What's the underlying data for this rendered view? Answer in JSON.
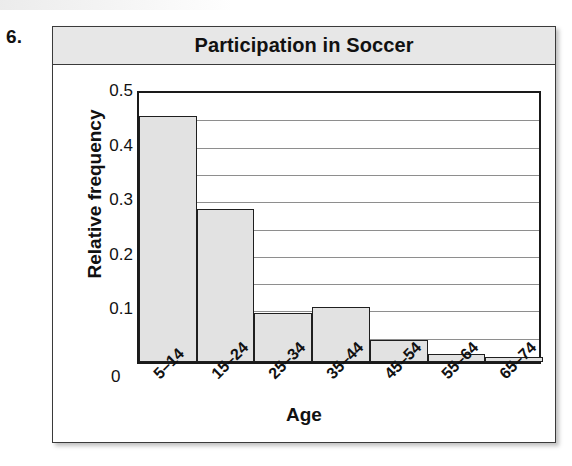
{
  "exercise": {
    "number": "6."
  },
  "chart_data": {
    "type": "bar",
    "title": "Participation in Soccer",
    "xlabel": "Age",
    "ylabel": "Relative frequency",
    "categories": [
      "5–14",
      "15–24",
      "25–34",
      "35–44",
      "45–54",
      "55–64",
      "65–74"
    ],
    "values": [
      0.45,
      0.28,
      0.09,
      0.1,
      0.04,
      0.015,
      0.01
    ],
    "ylim": [
      0,
      0.5
    ],
    "ytick_labels": [
      "0",
      "0.1",
      "0.2",
      "0.3",
      "0.4",
      "0.5"
    ],
    "ytick_values": [
      0,
      0.1,
      0.2,
      0.3,
      0.4,
      0.5
    ],
    "gridline_values": [
      0.05,
      0.1,
      0.15,
      0.2,
      0.25,
      0.3,
      0.35,
      0.4,
      0.45
    ],
    "grid": true,
    "legend": "none",
    "bar_fill_color": "#e2e2e2",
    "bar_border_color": "#1f1f1f",
    "title_bar_color": "#e7e7e7",
    "frame_color": "#3a3a3a",
    "gridline_color": "#8e8e8e"
  }
}
